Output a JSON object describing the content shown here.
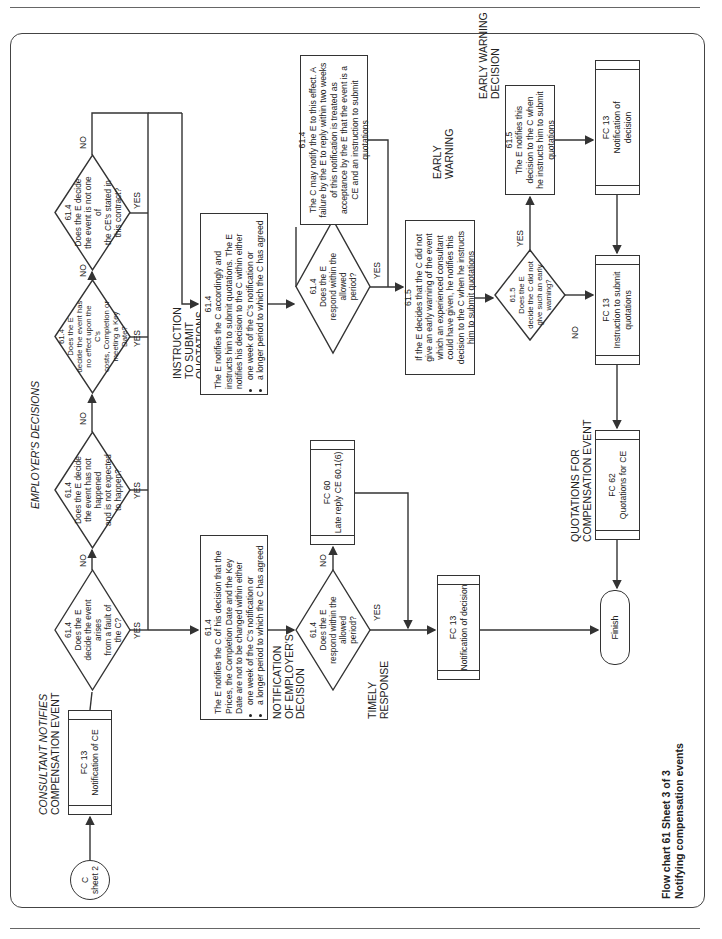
{
  "page": {
    "orientation": "rotated 90deg counterclockwise",
    "caption_line1": "Flow chart 61   Sheet 3 of 3",
    "caption_line2": "Notifying compensation events"
  },
  "sections": {
    "consultant_notifies": "CONSULTANT NOTIFIES COMPENSATION EVENT",
    "consultant_notifies_l1": "CONSULTANT NOTIFIES",
    "consultant_notifies_l2": "COMPENSATION EVENT",
    "employers_decisions": "EMPLOYER'S DECISIONS",
    "notification_l1": "NOTIFICATION",
    "notification_l2": "OF EMPLOYER'S",
    "notification_l3": "DECISION",
    "instruction_l1": "INSTRUCTION",
    "instruction_l2": "TO SUBMIT",
    "instruction_l3": "QUOTATIONS",
    "timely_l1": "TIMELY",
    "timely_l2": "RESPONSE",
    "early_warning_l1": "EARLY",
    "early_warning_l2": "WARNING",
    "ew_decision_l1": "EARLY WARNING",
    "ew_decision_l2": "DECISION",
    "quotations_l1": "QUOTATIONS FOR",
    "quotations_l2": "COMPENSATION EVENT"
  },
  "nodes": {
    "start": {
      "l1": "C",
      "l2": "sheet 2"
    },
    "fc13_notification_ce": {
      "l1": "FC 13",
      "l2": "Notification of CE"
    },
    "d1": {
      "ref": "61.4",
      "text": [
        "Does the E",
        "decide the event arises",
        "from a fault of",
        "the C?"
      ]
    },
    "d2": {
      "ref": "61.4",
      "text": [
        "Does the E decide",
        "the event has not happened",
        "and is not expected",
        "to happen?"
      ]
    },
    "d3": {
      "ref": "61.4",
      "text": [
        "Does the E",
        "decide the event has",
        "no effect upon the C's",
        "costs, Completion or",
        "meeting a Key",
        "Date?"
      ]
    },
    "d4": {
      "ref": "61.4",
      "text": [
        "Does the E decide",
        "the event is not one of",
        "the CE's stated in",
        "this contract?"
      ]
    },
    "box_notify_decision": {
      "ref": "61.4",
      "text": "The E notifies the C of his decision that the Prices, the Completion Date and the Key Date are not to be changed within either",
      "bullets": [
        "one week of the C's notification or",
        "a longer period to which the C has agreed"
      ]
    },
    "box_instruct": {
      "ref": "61.4",
      "text": "The E notifies the C accordingly and instructs him to submit quotations. The E notifies his decision to the C within either",
      "bullets": [
        "one week of the C's notification or",
        "a longer period to which the C has agreed"
      ]
    },
    "d_respond1": {
      "ref": "61.4",
      "text": [
        "Does the E",
        "respond within the",
        "allowed",
        "period?"
      ]
    },
    "d_respond2": {
      "ref": "61.4",
      "text": [
        "Does the E",
        "respond within the",
        "allowed",
        "period?"
      ]
    },
    "fc60": {
      "l1": "FC 60",
      "l2": "Late reply CE 60.1(6)"
    },
    "box_c_may_notify": {
      "ref": "61.4",
      "text": "The C may notify the E to this effect. A failure by the E to reply within two weeks of this notification is treated as acceptance by the E that the event is a CE and an instruction to submit quotations"
    },
    "fc13_notification_decision_mid": {
      "l1": "FC 13",
      "l2": "Notification of decision"
    },
    "box_early_warning": {
      "ref": "61.5",
      "text": "If the E decides that the C did not give an early warning of the event which an experienced consultant could have given, he notifies this decision to the C when he instructs him to submit quotations"
    },
    "d_early_warning": {
      "ref": "61.5",
      "text": [
        "Does the E",
        "decide the C did not",
        "give such an early",
        "warning?"
      ]
    },
    "box_ew_notify": {
      "ref": "61.5",
      "text": "The E notifies this decision to the C when he instructs him to submit quotations"
    },
    "fc13_notification_decision_right": {
      "l1": "FC 13",
      "l2": "Notification of",
      "l3": "decision"
    },
    "fc13_instruction": {
      "l1": "FC 13",
      "l2": "Instruction to submit",
      "l3": "quotations"
    },
    "fc62": {
      "l1": "FC 62",
      "l2": "Quotations for CE"
    },
    "finish": {
      "label": "Finish"
    }
  },
  "labels": {
    "yes": "YES",
    "no": "NO"
  }
}
